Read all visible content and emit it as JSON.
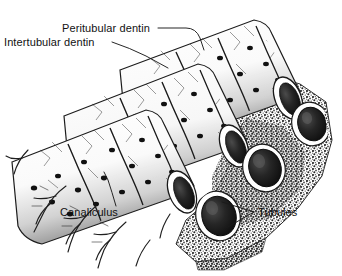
{
  "figure": {
    "kind": "anatomical-line-drawing",
    "width": 342,
    "height": 276,
    "background_color": "#ffffff",
    "ink_color": "#1a1a1a",
    "style": "black-and-white stipple and line engraving"
  },
  "labels": {
    "peritubular": "Peritubular dentin",
    "intertubular": "Intertubular dentin",
    "canaliculus": "Canaliculus",
    "tubules": "Tubules"
  },
  "structures": {
    "tubule_cylinders": 3,
    "tubule_openings": 3,
    "cut_face": "stippled cross-section"
  }
}
